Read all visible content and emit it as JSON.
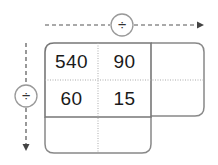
{
  "grid": {
    "cells": [
      [
        "540",
        "90",
        ""
      ],
      [
        "60",
        "15",
        ""
      ],
      [
        "",
        "",
        ""
      ]
    ]
  },
  "operators": {
    "horizontal": "÷",
    "vertical": "÷"
  },
  "colors": {
    "line": "#777777",
    "dotted": "#aaaaaa",
    "text": "#1a1a1a"
  }
}
